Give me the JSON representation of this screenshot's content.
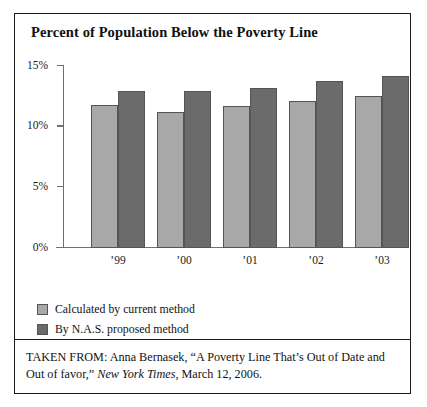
{
  "figure": {
    "title": "Percent of Population Below the Poverty Line",
    "caption": {
      "prefix": "TAKEN FROM: Anna Bernasek, “A Poverty Line That’s Out of Date and Out of favor,” ",
      "publication": "New York Times",
      "suffix": ", March 12, 2006."
    }
  },
  "colors": {
    "series_current_method": "#a8a8a8",
    "series_nas_method": "#6b6b6b",
    "axis": "#6f6f6f",
    "frame": "#1a1a1a",
    "text": "#121212"
  },
  "chart_data": {
    "type": "bar",
    "title": "Percent of Population Below the Poverty Line",
    "xlabel": "",
    "ylabel": "",
    "categories": [
      "’99",
      "’00",
      "’01",
      "’02",
      "’03"
    ],
    "series": [
      {
        "name": "Calculated by current method",
        "color": "#a8a8a8",
        "values": [
          11.8,
          11.2,
          11.7,
          12.1,
          12.5
        ]
      },
      {
        "name": "By N.A.S. proposed method",
        "color": "#6b6b6b",
        "values": [
          12.9,
          12.9,
          13.2,
          13.8,
          14.2
        ]
      }
    ],
    "ylim": [
      0,
      15
    ],
    "y_ticks": [
      0,
      5,
      10,
      15
    ],
    "y_tick_labels": [
      "0%",
      "5%",
      "10%",
      "15%"
    ],
    "grid": false,
    "legend_position": "below-plot-left"
  }
}
